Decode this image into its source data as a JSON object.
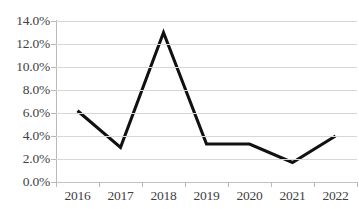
{
  "chart_data": {
    "type": "line",
    "title": "",
    "subtitle": "",
    "xlabel": "",
    "ylabel": "",
    "categories": [
      "2016",
      "2017",
      "2018",
      "2019",
      "2020",
      "2021",
      "2022"
    ],
    "series": [
      {
        "name": "",
        "values": [
          6.2,
          3.0,
          13.0,
          3.3,
          3.3,
          1.7,
          4.0
        ]
      }
    ],
    "ylim": [
      0.0,
      14.0
    ],
    "ytick_values": [
      0.0,
      2.0,
      4.0,
      6.0,
      8.0,
      10.0,
      12.0,
      14.0
    ],
    "ytick_labels": [
      "0.0%",
      "2.0%",
      "4.0%",
      "6.0%",
      "8.0%",
      "10.0%",
      "12.0%",
      "14.0%"
    ],
    "value_suffix": "%",
    "grid": true,
    "grid_axis": "y",
    "legend": false,
    "legend_position": "none",
    "markers": false,
    "line_color": "#111111",
    "grid_color": "#d7d7d7",
    "axis_color": "#b9b9b9",
    "text_color": "#3f3f3f",
    "background": "#ffffff",
    "annotations": []
  }
}
